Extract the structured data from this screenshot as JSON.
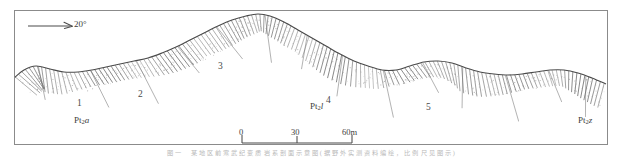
{
  "figure": {
    "type": "geological-cross-section",
    "frame": {
      "x": 14,
      "y": 10,
      "width": 594,
      "height": 135,
      "border_color": "#8b8b8b"
    },
    "line_color": "#4a4a4a",
    "hatch_color": "#6e6e6e",
    "stipple_color": "#9a9a9a"
  },
  "dip_symbol": {
    "label": "20°",
    "icon": "dip-arrow-icon",
    "arrow_x1": 28,
    "arrow_x2": 70,
    "arrow_y": 26
  },
  "units": [
    {
      "label": "1",
      "x": 77,
      "y": 103
    },
    {
      "label": "2",
      "x": 138,
      "y": 94
    },
    {
      "label": "3",
      "x": 218,
      "y": 66
    },
    {
      "label": "4",
      "x": 326,
      "y": 100
    },
    {
      "label": "5",
      "x": 426,
      "y": 107
    }
  ],
  "formations": [
    {
      "prefix": "Pt",
      "sub": "2",
      "suffix": "a",
      "x": 74,
      "y": 120,
      "name": "formation-left"
    },
    {
      "prefix": "Pt",
      "sub": "2",
      "suffix": "l",
      "x": 310,
      "y": 104,
      "name": "formation-center"
    },
    {
      "prefix": "Pt",
      "sub": "2",
      "suffix": "z",
      "x": 578,
      "y": 120,
      "name": "formation-right"
    }
  ],
  "scale_bar": {
    "x": 242,
    "y": 143,
    "length": 110,
    "ticks": [
      {
        "label": "0",
        "offset": 0
      },
      {
        "label": "30",
        "offset": 55
      },
      {
        "label": "60m",
        "offset": 110
      }
    ],
    "label_y": 130
  },
  "caption": {
    "text": "图 一 　 某 地 区 前 寒 武 纪 变 质 岩 系 剖 面 示 意 图 ( 据 野 外 实 测 资 料 编 绘 ， 比 例 尺 见 图 示 )"
  },
  "chart_data": {
    "type": "line",
    "xlabel": "Distance (m)",
    "ylabel": "Elevation (relative)",
    "x": [
      14,
      24,
      36,
      50,
      64,
      78,
      92,
      106,
      120,
      134,
      148,
      162,
      176,
      190,
      204,
      218,
      232,
      246,
      258,
      270,
      284,
      298,
      312,
      326,
      340,
      354,
      368,
      382,
      396,
      410,
      424,
      438,
      452,
      466,
      480,
      494,
      508,
      522,
      536,
      550,
      564,
      578,
      592,
      606
    ],
    "profile_y": [
      78,
      70,
      66,
      69,
      72,
      72,
      70,
      67,
      64,
      61,
      58,
      53,
      47,
      40,
      33,
      26,
      20,
      16,
      14,
      16,
      22,
      30,
      38,
      46,
      54,
      61,
      66,
      70,
      70,
      66,
      62,
      61,
      63,
      68,
      72,
      74,
      75,
      74,
      72,
      70,
      70,
      73,
      78,
      84
    ],
    "annotations": [
      "1",
      "2",
      "3",
      "4",
      "5",
      "Pt2a",
      "Pt2l",
      "Pt2z",
      "20°"
    ],
    "grid": false,
    "legend": false
  }
}
